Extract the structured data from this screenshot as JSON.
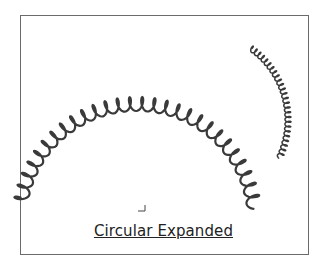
{
  "caption": "Circular Expanded",
  "colors": {
    "spring": "#3a3a3a",
    "frame": "#6b6b6b"
  },
  "springs": [
    {
      "name": "large-arc-spring",
      "cx": 137,
      "cy": 222,
      "r": 118,
      "start_deg": 190,
      "end_deg": 352,
      "coils": 28,
      "amp": 7,
      "width": 2.2
    },
    {
      "name": "small-curl-spring",
      "cx": 200,
      "cy": 120,
      "r": 88,
      "start_deg": 305,
      "end_deg": 385,
      "coils": 26,
      "amp": 3,
      "width": 1.5
    }
  ]
}
